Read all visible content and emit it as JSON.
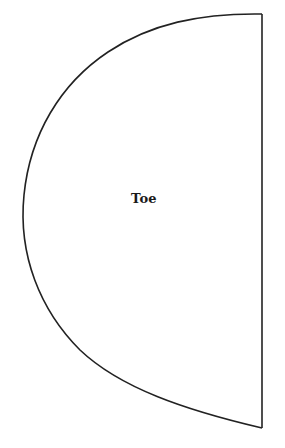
{
  "diagram": {
    "shape": "half-ellipse-pattern-piece",
    "label": "Toe",
    "stroke_color": "#222222",
    "fill_color": "#ffffff",
    "outline": {
      "top_right": [
        262,
        14
      ],
      "bottom_right": [
        262,
        428
      ],
      "leftmost": [
        23,
        200
      ]
    }
  }
}
